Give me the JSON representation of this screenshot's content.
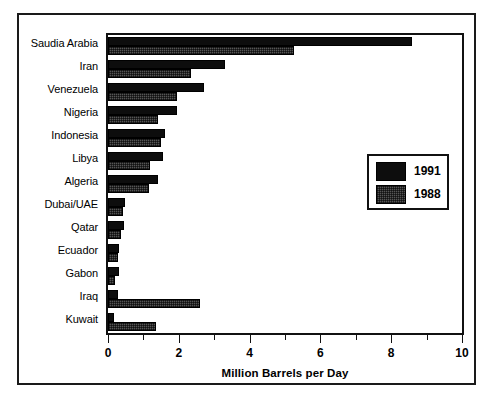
{
  "chart_data": {
    "type": "bar",
    "orientation": "horizontal",
    "title": "",
    "xlabel": "Million Barrels per Day",
    "ylabel": "",
    "xlim": [
      0,
      10
    ],
    "xticks": [
      0,
      1,
      2,
      3,
      4,
      5,
      6,
      7,
      8,
      9,
      10
    ],
    "xtick_labels": [
      "0",
      "",
      "2",
      "",
      "4",
      "",
      "6",
      "",
      "8",
      "",
      "10"
    ],
    "major_ticks": [
      0,
      2,
      4,
      6,
      8,
      10
    ],
    "minor_ticks": [
      1,
      3,
      5,
      7,
      9
    ],
    "grid": false,
    "legend_position": "center right",
    "categories": [
      "Saudia Arabia",
      "Iran",
      "Venezuela",
      "Nigeria",
      "Indonesia",
      "Libya",
      "Algeria",
      "Dubai/UAE",
      "Qatar",
      "Ecuador",
      "Gabon",
      "Iraq",
      "Kuwait"
    ],
    "series": [
      {
        "name": "1991",
        "color": "#0d0d0d",
        "values": [
          8.6,
          3.3,
          2.7,
          1.95,
          1.6,
          1.55,
          1.4,
          0.48,
          0.45,
          0.3,
          0.3,
          0.28,
          0.18
        ]
      },
      {
        "name": "1988",
        "color": "#555555",
        "values": [
          5.25,
          2.35,
          1.95,
          1.4,
          1.5,
          1.2,
          1.15,
          0.42,
          0.37,
          0.28,
          0.2,
          2.6,
          1.35
        ]
      }
    ]
  },
  "legend": {
    "entries": [
      {
        "label": "1991",
        "swatch": "solid-black"
      },
      {
        "label": "1988",
        "swatch": "hatched-gray"
      }
    ]
  },
  "axis": {
    "x_title": "Million Barrels per Day"
  }
}
